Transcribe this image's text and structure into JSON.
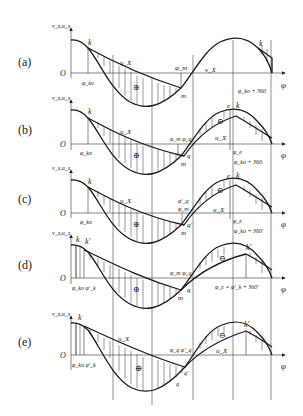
{
  "figure": {
    "axis_y_label": "v_x,u_x",
    "axis_x_label": "φ",
    "origin_label": "O",
    "plus_symbol": "⊕",
    "minus_symbol": "⊖"
  },
  "panels": [
    {
      "id": "a",
      "label": "(a)",
      "labels": {
        "k1": "k",
        "ux": "u_X",
        "phi_m": "φ_m",
        "vx": "v_X",
        "k2": "k",
        "phi_ko": "φ_ko",
        "m": "m",
        "phi_end": "φ_ko + 360"
      }
    },
    {
      "id": "b",
      "label": "(b)",
      "labels": {
        "k1": "k",
        "ux": "u_X",
        "phi_mq": "φ_m φ_q",
        "e": "e",
        "k2": "k",
        "ux2": "u_X",
        "phi_ko": "φ_ko",
        "q": "q",
        "m": "m",
        "phi_e": "φ_e",
        "phi_end": "φ_ko + 360"
      }
    },
    {
      "id": "c",
      "label": "(c)",
      "labels": {
        "k1": "k",
        "ux": "u_X",
        "phi_q": "φ'_q",
        "phi_m": "φ_m",
        "e": "e",
        "k2": "k",
        "ux2": "u_X",
        "phi_ko": "φ_ko",
        "q": "q'",
        "m": "m",
        "phi_e": "φ_e",
        "phi_end": "φ_ko + 360'"
      }
    },
    {
      "id": "d",
      "label": "(d)",
      "labels": {
        "k1": "k",
        "k1p": "k'",
        "phi_mq": "φ_m φ_q",
        "k2": "k'",
        "phi_ko": "φ_ko φ'_k",
        "q": "q",
        "m": "m",
        "phi_end": "φ_e = φ'_k + 360'"
      }
    },
    {
      "id": "e",
      "label": "(e)",
      "labels": {
        "k1": "k",
        "ux": "u_X",
        "phi_q": "φ_q φ'_q",
        "k2": "k'",
        "ux2": "u_X",
        "phi_ko": "φ_ko φ'_k",
        "qp": "q'",
        "q": "q"
      }
    }
  ]
}
